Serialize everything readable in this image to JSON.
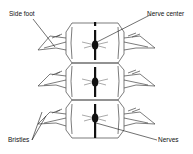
{
  "diagram": {
    "segments": 3,
    "labels": {
      "side_foot": "Side foot",
      "nerve_center": "Nerve center",
      "bristles": "Bristles",
      "nerves": "Nerves"
    },
    "colors": {
      "outline": "#333333",
      "nerve": "#111111",
      "background": "#ffffff"
    }
  }
}
